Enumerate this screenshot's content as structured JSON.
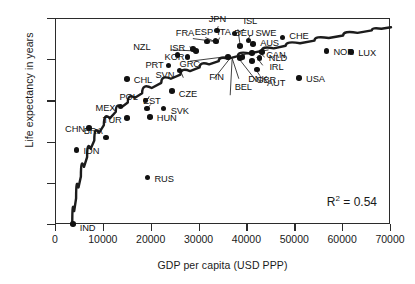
{
  "chart_data": {
    "type": "scatter",
    "title": "",
    "xlabel": "GDP per capita (USD PPP)",
    "ylabel": "Life expectancy in years",
    "xlim": [
      0,
      70000
    ],
    "ylim": [
      64,
      84
    ],
    "xticks": [
      0,
      10000,
      20000,
      30000,
      40000,
      50000,
      60000,
      70000
    ],
    "xticklabels": [
      "0",
      "10000",
      "20000",
      "30000",
      "40000",
      "50000",
      "60000",
      "70000"
    ],
    "yticks": [
      64,
      68,
      72,
      76,
      80,
      84
    ],
    "yticklabels": [
      "64",
      "68",
      "72",
      "76",
      "80",
      "84"
    ],
    "grid": false,
    "legend": null,
    "annotations": [
      {
        "name": "r-squared",
        "text_html": "R<sup>2</sup> = 0.54",
        "text": "R2 = 0.54",
        "value": 0.54
      }
    ],
    "trend": {
      "type": "logarithmic-fit-curve",
      "color": "#1c1c1c",
      "points": [
        [
          3400,
          64.1
        ],
        [
          4200,
          66.6
        ],
        [
          5200,
          68.7
        ],
        [
          6500,
          70.6
        ],
        [
          8000,
          72.2
        ],
        [
          10000,
          73.7
        ],
        [
          12500,
          75.0
        ],
        [
          15000,
          75.9
        ],
        [
          18000,
          76.8
        ],
        [
          22000,
          77.8
        ],
        [
          26000,
          78.6
        ],
        [
          30000,
          79.3
        ],
        [
          34000,
          79.9
        ],
        [
          38000,
          80.4
        ],
        [
          43000,
          80.9
        ],
        [
          48000,
          81.4
        ],
        [
          54000,
          81.9
        ],
        [
          60000,
          82.4
        ],
        [
          66000,
          82.9
        ],
        [
          70000,
          83.2
        ]
      ]
    },
    "points": [
      {
        "code": "IND",
        "x": 3500,
        "y": 64.1,
        "label_dx": 7,
        "label_dy": 4
      },
      {
        "code": "IDN",
        "x": 4300,
        "y": 71.3,
        "label_dx": 7,
        "label_dy": 1
      },
      {
        "code": "CHN",
        "x": 6900,
        "y": 73.4,
        "label_dx": -24,
        "label_dy": 1
      },
      {
        "code": "BRA",
        "x": 10400,
        "y": 72.5,
        "label_dx": -22,
        "label_dy": -6
      },
      {
        "code": "RUS",
        "x": 19100,
        "y": 68.6,
        "label_dx": 7,
        "label_dy": 1
      },
      {
        "code": "TUR",
        "x": 14800,
        "y": 74.4,
        "label_dx": -24,
        "label_dy": 2
      },
      {
        "code": "MEX",
        "x": 13500,
        "y": 75.5,
        "label_dx": -25,
        "label_dy": 1
      },
      {
        "code": "HUN",
        "x": 19600,
        "y": 74.5,
        "label_dx": 7,
        "label_dy": 1
      },
      {
        "code": "EST",
        "x": 19000,
        "y": 75.3,
        "label_dx": -4,
        "label_dy": -8
      },
      {
        "code": "SVK",
        "x": 22500,
        "y": 75.3,
        "label_dx": 7,
        "label_dy": 2
      },
      {
        "code": "POL",
        "x": 18700,
        "y": 76.1,
        "label_dx": -26,
        "label_dy": -3
      },
      {
        "code": "CZE",
        "x": 24200,
        "y": 77.0,
        "label_dx": 7,
        "label_dy": 3
      },
      {
        "code": "CHL",
        "x": 14800,
        "y": 78.2,
        "label_dx": 7,
        "label_dy": 1
      },
      {
        "code": "SVN",
        "x": 25800,
        "y": 79.0,
        "label_dx": -24,
        "label_dy": 4
      },
      {
        "code": "PRT",
        "x": 23500,
        "y": 79.5,
        "label_dx": -23,
        "label_dy": 0
      },
      {
        "code": "KOR",
        "x": 27500,
        "y": 80.3,
        "label_dx": -23,
        "label_dy": 0
      },
      {
        "code": "GRC",
        "x": 25400,
        "y": 80.5,
        "label_dx": 2,
        "label_dy": 9
      },
      {
        "code": "ISR",
        "x": 28600,
        "y": 81.1,
        "label_dx": -23,
        "label_dy": -1
      },
      {
        "code": "NZL",
        "x": 29300,
        "y": 80.9,
        "label_dx": -63,
        "label_dy": -4
      },
      {
        "code": "FRA",
        "x": 33400,
        "y": 81.8,
        "label_dx": -40,
        "label_dy": -9
      },
      {
        "code": "ESP",
        "x": 31500,
        "y": 81.8,
        "label_dx": -12,
        "label_dy": -10
      },
      {
        "code": "ITA",
        "x": 33300,
        "y": 81.9,
        "label_dx": 2,
        "label_dy": -9
      },
      {
        "code": "JPN",
        "x": 33600,
        "y": 82.9,
        "label_dx": -8,
        "label_dy": -11
      },
      {
        "code": "DEU",
        "x": 38500,
        "y": 81.4,
        "label_dx": -6,
        "label_dy": -13
      },
      {
        "code": "ISL",
        "x": 37300,
        "y": 82.6,
        "label_dx": 9,
        "label_dy": -12
      },
      {
        "code": "SWE",
        "x": 40200,
        "y": 81.9,
        "label_dx": 7,
        "label_dy": -8
      },
      {
        "code": "AUS",
        "x": 41200,
        "y": 81.6,
        "label_dx": 7,
        "label_dy": -1
      },
      {
        "code": "CHE",
        "x": 47300,
        "y": 82.2,
        "label_dx": 7,
        "label_dy": -2
      },
      {
        "code": "CAN",
        "x": 41000,
        "y": 80.7,
        "label_dx": 14,
        "label_dy": 2
      },
      {
        "code": "NLD",
        "x": 43000,
        "y": 80.8,
        "label_dx": 7,
        "label_dy": 6
      },
      {
        "code": "FIN",
        "x": 36000,
        "y": 80.3,
        "label_dx": -19,
        "label_dy": 20
      },
      {
        "code": "DNK",
        "x": 41000,
        "y": 79.9,
        "label_dx": -4,
        "label_dy": 18
      },
      {
        "code": "IRL",
        "x": 42500,
        "y": 80.2,
        "label_dx": 10,
        "label_dy": 9
      },
      {
        "code": "AUT",
        "x": 42000,
        "y": 79.1,
        "label_dx": 10,
        "label_dy": 14
      },
      {
        "code": "GBR",
        "x": 38500,
        "y": 80.2,
        "label_dx": 16,
        "label_dy": 22
      },
      {
        "code": "BEL",
        "x": 39000,
        "y": 80.3,
        "label_dx": -8,
        "label_dy": 30
      },
      {
        "code": "USA",
        "x": 50800,
        "y": 78.3,
        "label_dx": 7,
        "label_dy": 1
      },
      {
        "code": "NOR",
        "x": 56500,
        "y": 80.9,
        "label_dx": 7,
        "label_dy": 1
      },
      {
        "code": "LUX",
        "x": 61700,
        "y": 80.8,
        "label_dx": 7,
        "label_dy": 1
      }
    ],
    "leader_lines": [
      {
        "code": "NZL",
        "from_x": 24000,
        "from_y": 81.0,
        "to_x": 29300,
        "to_y": 80.9
      },
      {
        "code": "FRA",
        "from_x": 28600,
        "from_y": 82.1,
        "to_x": 33400,
        "to_y": 81.8
      },
      {
        "code": "ESP",
        "from_x": 31200,
        "from_y": 82.2,
        "to_x": 33000,
        "to_y": 81.85
      },
      {
        "code": "JPN",
        "from_x": 33900,
        "from_y": 83.3,
        "to_x": 33600,
        "to_y": 82.9
      },
      {
        "code": "ITA",
        "from_x": 34200,
        "from_y": 82.2,
        "to_x": 33600,
        "to_y": 81.6
      },
      {
        "code": "DEU",
        "from_x": 38000,
        "from_y": 83.0,
        "to_x": 38500,
        "to_y": 81.4
      },
      {
        "code": "ISL",
        "from_x": 39300,
        "from_y": 83.0,
        "to_x": 37600,
        "to_y": 82.6
      },
      {
        "code": "SWE",
        "from_x": 40600,
        "from_y": 82.4,
        "to_x": 39900,
        "to_y": 81.9
      },
      {
        "code": "CAN",
        "from_x": 44400,
        "from_y": 81.0,
        "to_x": 38800,
        "to_y": 80.5
      },
      {
        "code": "GRC",
        "from_x": 28000,
        "from_y": 79.9,
        "to_x": 36500,
        "to_y": 80.4
      },
      {
        "code": "FIN",
        "from_x": 33000,
        "from_y": 78.2,
        "to_x": 36400,
        "to_y": 80.2
      },
      {
        "code": "DNK",
        "from_x": 38200,
        "from_y": 78.2,
        "to_x": 36800,
        "to_y": 80.2
      },
      {
        "code": "BEL",
        "from_x": 36400,
        "from_y": 76.6,
        "to_x": 36800,
        "to_y": 80.1
      },
      {
        "code": "GBR",
        "from_x": 42000,
        "from_y": 77.9,
        "to_x": 38300,
        "to_y": 80.1
      },
      {
        "code": "AUT",
        "from_x": 42600,
        "from_y": 78.5,
        "to_x": 41600,
        "to_y": 79.2
      },
      {
        "code": "IRL",
        "from_x": 43200,
        "from_y": 79.5,
        "to_x": 41900,
        "to_y": 80.3
      },
      {
        "code": "NLD",
        "from_x": 43600,
        "from_y": 80.3,
        "to_x": 42400,
        "to_y": 80.8
      },
      {
        "code": "SVN",
        "from_x": 26600,
        "from_y": 78.3,
        "to_x": 26000,
        "to_y": 79.0
      },
      {
        "code": "POL",
        "from_x": 19500,
        "from_y": 76.5,
        "to_x": 18900,
        "to_y": 76.0
      },
      {
        "code": "EST",
        "from_x": 19800,
        "from_y": 75.7,
        "to_x": 19000,
        "to_y": 75.3
      },
      {
        "code": "ISR",
        "from_x": 27900,
        "from_y": 81.3,
        "to_x": 28400,
        "to_y": 81.2
      }
    ]
  }
}
